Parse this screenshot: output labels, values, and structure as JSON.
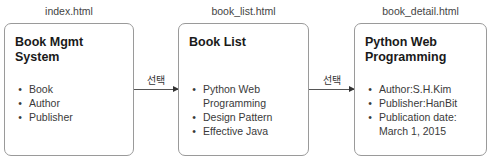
{
  "pages": [
    {
      "filename": "index.html",
      "title_lines": [
        "Book Mgmt System"
      ],
      "items": [
        "Book",
        "Author",
        "Publisher"
      ]
    },
    {
      "filename": "book_list.html",
      "title_lines": [
        "Book List"
      ],
      "items": [
        "Python Web Programming",
        "Design Pattern",
        "Effective Java"
      ]
    },
    {
      "filename": "book_detail.html",
      "title_lines": [
        "Python Web",
        "Programming"
      ],
      "items": [
        "Author:S.H.Kim",
        "Publisher:HanBit",
        "Publication date: March 1, 2015"
      ]
    }
  ],
  "arrows": [
    {
      "label": "선택",
      "from": "index.html",
      "to": "book_list.html"
    },
    {
      "label": "선택",
      "from": "book_list.html",
      "to": "book_detail.html"
    }
  ],
  "bullet": "•",
  "colors": {
    "box_border": "#9a9a9a",
    "arrow": "#555555",
    "title_text": "#1a1a1a",
    "body_text": "#3a3a3a"
  }
}
